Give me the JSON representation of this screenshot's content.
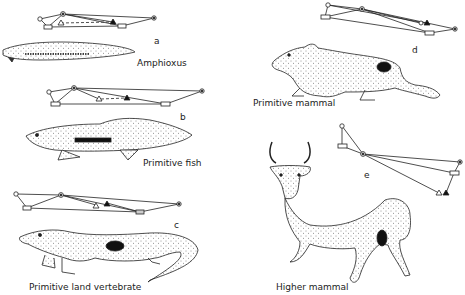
{
  "figure": {
    "panels": [
      {
        "id": "a",
        "letter": "a",
        "caption": "Amphioxus"
      },
      {
        "id": "b",
        "letter": "b",
        "caption": "Primitive fish"
      },
      {
        "id": "c",
        "letter": "c",
        "caption": "Primitive land vertebrate"
      },
      {
        "id": "d",
        "letter": "d",
        "caption": "Primitive mammal"
      },
      {
        "id": "e",
        "letter": "e",
        "caption": "Higher mammal"
      }
    ],
    "node_symbols": [
      "open-circle",
      "dotted-circle",
      "open-rectangle",
      "open-triangle",
      "filled-triangle"
    ],
    "colors": {
      "ink": "#222222",
      "fill_dark": "#111111",
      "body_fill": "#f4f4f4"
    }
  }
}
